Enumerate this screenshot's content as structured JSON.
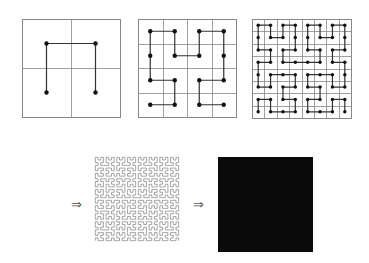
{
  "figure": {
    "colors": {
      "grid": "#888888",
      "curve": "#333333",
      "dot": "#111111",
      "dense_curve": "#9a9a9a",
      "limit_fill": "#0a0a0a"
    },
    "panels": [
      {
        "id": "order-1",
        "order": 1,
        "x": 22,
        "y": 19,
        "size": 98,
        "show_grid": true,
        "show_dots": true
      },
      {
        "id": "order-2",
        "order": 2,
        "x": 138,
        "y": 19,
        "size": 98,
        "show_grid": true,
        "show_dots": true
      },
      {
        "id": "order-3",
        "order": 3,
        "x": 252,
        "y": 19,
        "size": 99,
        "show_grid": true,
        "show_dots": true
      },
      {
        "id": "order-high",
        "order": 5,
        "x": 94,
        "y": 156,
        "size": 86,
        "show_grid": false,
        "show_dots": false
      },
      {
        "id": "limit",
        "order": 0,
        "x": 218,
        "y": 157,
        "size": 95,
        "filled": true
      }
    ],
    "arrows": [
      {
        "glyph": "⇒",
        "x": 71,
        "y": 198
      },
      {
        "glyph": "⇒",
        "x": 193,
        "y": 198
      }
    ]
  }
}
